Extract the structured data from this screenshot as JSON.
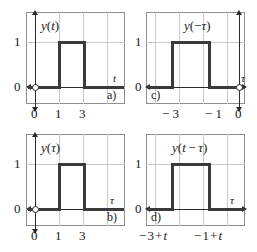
{
  "figure": {
    "panels": [
      {
        "id": "panel-a",
        "tag": "a)",
        "function_label": "y(t)",
        "function_parts": {
          "y": "y",
          "open": "(",
          "arg": "t",
          "close": ")"
        },
        "axis_label": "t",
        "y_tick": "1",
        "y_zero": "0",
        "x_ticks": [
          "0",
          "1",
          "3"
        ],
        "pulse": {
          "start": "1",
          "end": "3",
          "height": "1"
        },
        "has_vertical_axis": true,
        "vertical_axis_side": "left",
        "origin_marker": "open-circle"
      },
      {
        "id": "panel-c",
        "tag": "c)",
        "function_label": "y(-τ)",
        "function_parts": {
          "y": "y",
          "open": "(",
          "sign": "−",
          "arg": "τ",
          "close": ")"
        },
        "axis_label": "τ",
        "y_tick": "1",
        "y_zero": "0",
        "x_ticks": [
          "− 3",
          "− 1",
          "0"
        ],
        "pulse": {
          "start": "−3",
          "end": "−1",
          "height": "1"
        },
        "has_vertical_axis": true,
        "vertical_axis_side": "right",
        "origin_marker": "open-circle"
      },
      {
        "id": "panel-b",
        "tag": "b)",
        "function_label": "y(τ)",
        "function_parts": {
          "y": "y",
          "open": "(",
          "arg": "τ",
          "close": ")"
        },
        "axis_label": "τ",
        "y_tick": "1",
        "y_zero": "0",
        "x_ticks": [
          "0",
          "1",
          "3"
        ],
        "pulse": {
          "start": "1",
          "end": "3",
          "height": "1"
        },
        "has_vertical_axis": true,
        "vertical_axis_side": "left",
        "origin_marker": "open-circle"
      },
      {
        "id": "panel-d",
        "tag": "d)",
        "function_label": "y(t − τ)",
        "function_parts": {
          "y": "y",
          "open": "(",
          "arg1": "t",
          "minus": "−",
          "arg2": "τ",
          "close": ")"
        },
        "axis_label": "τ",
        "y_tick": "1",
        "y_zero": "0",
        "x_ticks": [
          "− 3 + t",
          "− 1 + t"
        ],
        "pulse": {
          "start": "−3+t",
          "end": "−1+t",
          "height": "1"
        },
        "has_vertical_axis": false,
        "vertical_axis_side": "none",
        "origin_marker": "none"
      }
    ]
  },
  "chart_data": {
    "type": "line",
    "title": "",
    "subplots": [
      {
        "label": "a)",
        "title": "y(t)",
        "xlabel": "t",
        "ylabel": "",
        "xticks": [
          0,
          1,
          3
        ],
        "xticklabels": [
          "0",
          "1",
          "3"
        ],
        "yticks": [
          0,
          1
        ],
        "yticklabels": [
          "0",
          "1"
        ],
        "xlim": [
          -0.6,
          4.4
        ],
        "ylim": [
          -0.55,
          1.55
        ],
        "grid": true,
        "series": [
          {
            "name": "y(t)",
            "x": [
              -0.6,
              1,
              1,
              3,
              3,
              4.4
            ],
            "y": [
              0,
              0,
              1,
              1,
              0,
              0
            ]
          }
        ]
      },
      {
        "label": "c)",
        "title": "y(-τ)",
        "xlabel": "τ",
        "ylabel": "",
        "xticks": [
          -3,
          -1,
          0
        ],
        "xticklabels": [
          "− 3",
          "− 1",
          "0"
        ],
        "yticks": [
          0,
          1
        ],
        "yticklabels": [
          "0",
          "1"
        ],
        "xlim": [
          -4.4,
          0.6
        ],
        "ylim": [
          -0.55,
          1.55
        ],
        "grid": true,
        "series": [
          {
            "name": "y(-τ)",
            "x": [
              -4.4,
              -3,
              -3,
              -1,
              -1,
              0.6
            ],
            "y": [
              0,
              0,
              1,
              1,
              0,
              0
            ]
          }
        ]
      },
      {
        "label": "b)",
        "title": "y(τ)",
        "xlabel": "τ",
        "ylabel": "",
        "xticks": [
          0,
          1,
          3
        ],
        "xticklabels": [
          "0",
          "1",
          "3"
        ],
        "yticks": [
          0,
          1
        ],
        "yticklabels": [
          "0",
          "1"
        ],
        "xlim": [
          -0.6,
          4.4
        ],
        "ylim": [
          -0.55,
          1.55
        ],
        "grid": true,
        "series": [
          {
            "name": "y(τ)",
            "x": [
              -0.6,
              1,
              1,
              3,
              3,
              4.4
            ],
            "y": [
              0,
              0,
              1,
              1,
              0,
              0
            ]
          }
        ]
      },
      {
        "label": "d)",
        "title": "y(t − τ)",
        "xlabel": "τ",
        "ylabel": "",
        "xticks": [
          "-3+t",
          "-1+t"
        ],
        "xticklabels": [
          "− 3 + t",
          "− 1 + t"
        ],
        "yticks": [
          0,
          1
        ],
        "yticklabels": [
          "0",
          "1"
        ],
        "xlim": [
          -4.4,
          0.6
        ],
        "ylim": [
          -0.55,
          1.55
        ],
        "grid": true,
        "series": [
          {
            "name": "y(t-τ)",
            "x": [
              -4.4,
              -3,
              -3,
              -1,
              -1,
              0.6
            ],
            "y": [
              0,
              0,
              1,
              1,
              0,
              0
            ]
          }
        ]
      }
    ]
  },
  "colors": {
    "background": "#ffffff",
    "frame": "#8e8e8e",
    "grid": "#c9c9c9",
    "signal": "#3a3a3a",
    "axis": "#2b2b2b",
    "text": "#1a1a1a"
  }
}
